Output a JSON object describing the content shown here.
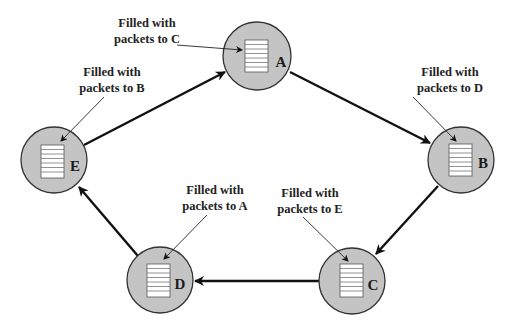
{
  "diagram": {
    "type": "ring-network",
    "colors": {
      "node_fill": "#c4c4c4",
      "node_stroke": "#333333",
      "buffer_fill": "#ffffff",
      "arrow": "#111111"
    },
    "nodes": [
      {
        "id": "A",
        "label": "A",
        "cx": 257,
        "cy": 56
      },
      {
        "id": "B",
        "label": "B",
        "cx": 461,
        "cy": 160
      },
      {
        "id": "C",
        "label": "C",
        "cx": 352,
        "cy": 281
      },
      {
        "id": "D",
        "label": "D",
        "cx": 160,
        "cy": 280
      },
      {
        "id": "E",
        "label": "E",
        "cx": 54,
        "cy": 160
      }
    ],
    "edges": [
      {
        "from": "E",
        "to": "A"
      },
      {
        "from": "A",
        "to": "B"
      },
      {
        "from": "B",
        "to": "C"
      },
      {
        "from": "C",
        "to": "D"
      },
      {
        "from": "D",
        "to": "E"
      }
    ],
    "annotations": [
      {
        "node": "A",
        "line1": "Filled with",
        "line2": "packets to C"
      },
      {
        "node": "B",
        "line1": "Filled with",
        "line2": "packets to D"
      },
      {
        "node": "C",
        "line1": "Filled with",
        "line2": "packets to E"
      },
      {
        "node": "D",
        "line1": "Filled with",
        "line2": "packets to A"
      },
      {
        "node": "E",
        "line1": "Filled with",
        "line2": "packets to B"
      }
    ]
  }
}
